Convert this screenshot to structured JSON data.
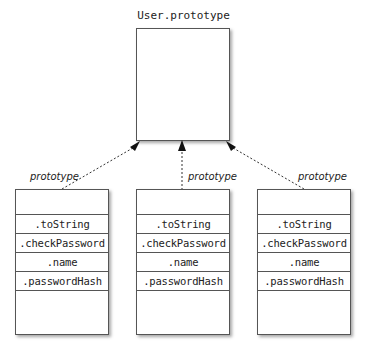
{
  "diagram": {
    "prototype_box": {
      "title": "User.prototype"
    },
    "edge_label": "prototype",
    "objects": [
      {
        "id": "left",
        "properties": [
          ".toString",
          ".checkPassword",
          ".name",
          ".passwordHash"
        ],
        "edge_label": "prototype"
      },
      {
        "id": "middle",
        "properties": [
          ".toString",
          ".checkPassword",
          ".name",
          ".passwordHash"
        ],
        "edge_label": "prototype"
      },
      {
        "id": "right",
        "properties": [
          ".toString",
          ".checkPassword",
          ".name",
          ".passwordHash"
        ],
        "edge_label": "prototype"
      }
    ],
    "colors": {
      "line": "#555555",
      "text": "#222222",
      "background": "#ffffff"
    }
  }
}
